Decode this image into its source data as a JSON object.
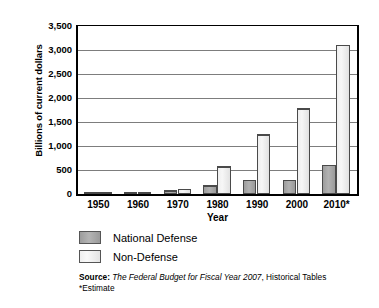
{
  "chart_data": {
    "type": "bar",
    "title": "",
    "xlabel": "Year",
    "ylabel": "Billions of current dollars",
    "categories": [
      "1950",
      "1960",
      "1970",
      "1980",
      "1990",
      "2000",
      "2010*"
    ],
    "ylim": [
      0,
      3500
    ],
    "ytick_values": [
      0,
      500,
      1000,
      1500,
      2000,
      2500,
      3000,
      3500
    ],
    "ytick_labels": [
      "0",
      "500",
      "1,000",
      "1,500",
      "2,000",
      "2,500",
      "3,000",
      "3,500"
    ],
    "grid": true,
    "legend_position": "below-axes-left",
    "series": [
      {
        "name": "National Defense",
        "color": "#a9a9a9",
        "values": [
          13,
          48,
          82,
          190,
          300,
          300,
          610
        ]
      },
      {
        "name": "Non-Defense",
        "color": "#eeeeee",
        "values": [
          30,
          45,
          113,
          580,
          1250,
          1790,
          3120
        ]
      }
    ]
  },
  "legend": {
    "items": [
      {
        "label": "National Defense"
      },
      {
        "label": "Non-Defense"
      }
    ]
  },
  "source": {
    "label": "Source:",
    "italic_part": "The Federal Budget for Fiscal Year 2007",
    "rest": ", Historical Tables",
    "footnote": "*Estimate"
  }
}
